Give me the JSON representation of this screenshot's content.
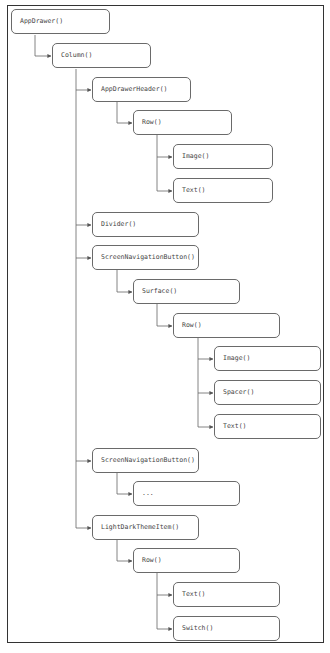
{
  "diagram": {
    "title": "",
    "nodes": [
      {
        "id": "n0",
        "label": "AppDrawer()",
        "level": 0,
        "parent": null
      },
      {
        "id": "n1",
        "label": "Column()",
        "level": 1,
        "parent": "n0"
      },
      {
        "id": "n2",
        "label": "AppDrawerHeader()",
        "level": 2,
        "parent": "n1"
      },
      {
        "id": "n3",
        "label": "Row()",
        "level": 3,
        "parent": "n2"
      },
      {
        "id": "n4",
        "label": "Image()",
        "level": 4,
        "parent": "n3"
      },
      {
        "id": "n5",
        "label": "Text()",
        "level": 4,
        "parent": "n3"
      },
      {
        "id": "n6",
        "label": "Divider()",
        "level": 2,
        "parent": "n1"
      },
      {
        "id": "n7",
        "label": "ScreenNavigationButton()",
        "level": 2,
        "parent": "n1"
      },
      {
        "id": "n8",
        "label": "Surface()",
        "level": 3,
        "parent": "n7"
      },
      {
        "id": "n9",
        "label": "Row()",
        "level": 4,
        "parent": "n8"
      },
      {
        "id": "n10",
        "label": "Image()",
        "level": 5,
        "parent": "n9"
      },
      {
        "id": "n11",
        "label": "Spacer()",
        "level": 5,
        "parent": "n9"
      },
      {
        "id": "n12",
        "label": "Text()",
        "level": 5,
        "parent": "n9"
      },
      {
        "id": "n13",
        "label": "ScreenNavigationButton()",
        "level": 2,
        "parent": "n1"
      },
      {
        "id": "n14",
        "label": "...",
        "level": 3,
        "parent": "n13"
      },
      {
        "id": "n15",
        "label": "LightDarkThemeItem()",
        "level": 2,
        "parent": "n1"
      },
      {
        "id": "n16",
        "label": "Row()",
        "level": 3,
        "parent": "n15"
      },
      {
        "id": "n17",
        "label": "Text()",
        "level": 4,
        "parent": "n16"
      },
      {
        "id": "n18",
        "label": "Switch()",
        "level": 4,
        "parent": "n16"
      }
    ],
    "colors": {
      "stroke": "#6a6a6a",
      "text": "#444444",
      "frame": "#333333",
      "background": "#ffffff"
    }
  }
}
